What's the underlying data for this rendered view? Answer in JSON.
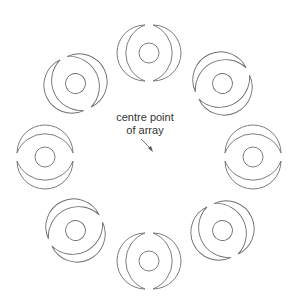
{
  "diagram": {
    "title": "",
    "annotation": {
      "line1": "centre point",
      "line2": "of array"
    },
    "array": {
      "type": "polar",
      "count": 8,
      "centre": [
        149,
        157
      ],
      "radius": 104,
      "stroke_color": "#6e6e6e",
      "element": {
        "inner_circle_radius": 10,
        "crescent_outer_radius": 30,
        "crescent_inner_radius": 23,
        "description": "two mirrored crescents around a small circle"
      }
    }
  }
}
